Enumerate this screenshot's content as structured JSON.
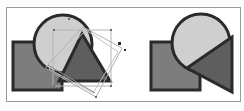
{
  "figure": {
    "colors": {
      "background": "#fdfdfd",
      "frame": "#9a9a9a",
      "outline": "#2a2a2a",
      "square_fill": "#7d7d7d",
      "circle_fill": "#cfcfcf",
      "triangle_fill": "#5e5e5e",
      "selection_box": "#b5b5b5",
      "handle": "#6a6a6a"
    },
    "left_panel": {
      "label": "before",
      "shapes": [
        "square",
        "circle",
        "triangle"
      ],
      "selection": "rotated bounding box with handles"
    },
    "right_panel": {
      "label": "after",
      "shapes": [
        "square",
        "circle",
        "triangle"
      ]
    }
  }
}
